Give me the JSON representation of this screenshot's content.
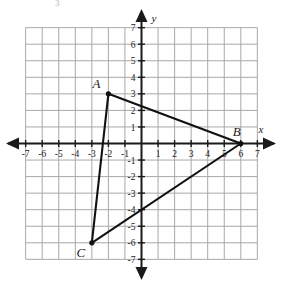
{
  "figure": {
    "kind": "coordinate-plane-triangle",
    "background_color": "#ffffff",
    "grid_color": "#a8a8a8",
    "axis_color": "#1a1a1a",
    "shape_color": "#111111",
    "stray_mark": "3"
  },
  "axes": {
    "x_name": "x",
    "y_name": "y",
    "x_min": -7,
    "x_max": 7,
    "y_min": -7,
    "y_max": 7,
    "x_tick_labels": [
      "-7",
      "-6",
      "-5",
      "-4",
      "-3",
      "-2",
      "-1",
      "1",
      "2",
      "3",
      "4",
      "5",
      "6",
      "7"
    ],
    "y_tick_labels": [
      "7",
      "6",
      "5",
      "4",
      "3",
      "2",
      "1",
      "-1",
      "-2",
      "-3",
      "-4",
      "-5",
      "-6",
      "-7"
    ]
  },
  "chart_data": {
    "type": "scatter",
    "title": "",
    "xlabel": "x",
    "ylabel": "y",
    "xlim": [
      -7,
      7
    ],
    "ylim": [
      -7,
      7
    ],
    "grid": true,
    "legend": "none",
    "points": [
      {
        "label": "A",
        "x": -2,
        "y": 3
      },
      {
        "label": "B",
        "x": 6,
        "y": 0
      },
      {
        "label": "C",
        "x": -3,
        "y": -6
      }
    ],
    "edges": [
      {
        "from": "A",
        "to": "B"
      },
      {
        "from": "B",
        "to": "C"
      },
      {
        "from": "C",
        "to": "A"
      }
    ]
  },
  "vertices": {
    "a": {
      "label": "A",
      "x": -2,
      "y": 3
    },
    "b": {
      "label": "B",
      "x": 6,
      "y": 0
    },
    "c": {
      "label": "C",
      "x": -3,
      "y": -6
    }
  }
}
